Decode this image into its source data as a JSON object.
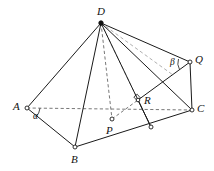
{
  "figure": {
    "background_color": "#ffffff",
    "stroke_color": "#1a1a1a",
    "width": 214,
    "height": 171
  },
  "points": [
    {
      "id": "D",
      "label": "D",
      "x": 101,
      "y": 23,
      "marker": "filled",
      "label_x": 97,
      "label_y": 6
    },
    {
      "id": "A",
      "label": "A",
      "x": 27,
      "y": 108,
      "marker": "open",
      "label_x": 13,
      "label_y": 101
    },
    {
      "id": "B",
      "label": "B",
      "x": 75,
      "y": 147,
      "marker": "open",
      "label_x": 71,
      "label_y": 154
    },
    {
      "id": "C",
      "label": "C",
      "x": 192,
      "y": 110,
      "marker": "open",
      "label_x": 197,
      "label_y": 103
    },
    {
      "id": "Q",
      "label": "Q",
      "x": 190,
      "y": 62,
      "marker": "open",
      "label_x": 195,
      "label_y": 54
    },
    {
      "id": "P",
      "label": "P",
      "x": 112,
      "y": 119,
      "marker": "open",
      "label_x": 106,
      "label_y": 125
    },
    {
      "id": "R",
      "label": "R",
      "x": 138,
      "y": 100,
      "marker": "open",
      "label_x": 144,
      "label_y": 95
    },
    {
      "id": "F",
      "label": "",
      "x": 151,
      "y": 127,
      "marker": "open",
      "label_x": 0,
      "label_y": 0
    }
  ],
  "angles": [
    {
      "id": "alpha",
      "label": "α",
      "vertex": "A",
      "label_x": 33,
      "label_y": 112
    },
    {
      "id": "beta",
      "label": "β",
      "vertex": "Q",
      "label_x": 170,
      "label_y": 58
    }
  ],
  "edges": [
    {
      "id": "DA",
      "from": "D",
      "to": "A",
      "style": "solid"
    },
    {
      "id": "DB",
      "from": "D",
      "to": "B",
      "style": "solid"
    },
    {
      "id": "DC",
      "from": "D",
      "to": "C",
      "style": "solid"
    },
    {
      "id": "DQ",
      "from": "D",
      "to": "Q",
      "style": "solid"
    },
    {
      "id": "DF",
      "from": "D",
      "to": "F",
      "style": "solid"
    },
    {
      "id": "AB",
      "from": "A",
      "to": "B",
      "style": "solid"
    },
    {
      "id": "BC",
      "from": "B",
      "to": "C",
      "style": "solid"
    },
    {
      "id": "QC",
      "from": "Q",
      "to": "C",
      "style": "solid"
    },
    {
      "id": "QR",
      "from": "Q",
      "to": "R",
      "style": "solid"
    },
    {
      "id": "RF",
      "from": "R",
      "to": "F",
      "style": "solid"
    },
    {
      "id": "AC",
      "from": "A",
      "to": "C",
      "style": "dashed"
    },
    {
      "id": "DP",
      "from": "D",
      "to": "P",
      "style": "dashed"
    },
    {
      "id": "PR",
      "from": "P",
      "to": "R",
      "style": "dashed"
    },
    {
      "id": "DR",
      "from": "D",
      "to": "R",
      "style": "dashed-light"
    },
    {
      "id": "PA",
      "from": "P",
      "to": "A",
      "style": "dashed-hidden"
    }
  ],
  "markers": {
    "right_angle_at": "R",
    "right_angle_size": 5
  }
}
